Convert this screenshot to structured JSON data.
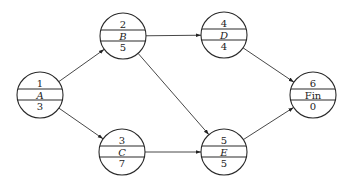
{
  "diagram": {
    "type": "activity-on-node network",
    "colors": {
      "stroke": "#2a2a2a",
      "edge": "#333333",
      "background": "#ffffff"
    },
    "radius": 23,
    "nodes": [
      {
        "id": "A",
        "top": "1",
        "name": "A",
        "bottom": "3",
        "cx": 40,
        "cy": 95,
        "italic": true
      },
      {
        "id": "B",
        "top": "2",
        "name": "B",
        "bottom": "5",
        "cx": 123,
        "cy": 36,
        "italic": true
      },
      {
        "id": "C",
        "top": "3",
        "name": "C",
        "bottom": "7",
        "cx": 122,
        "cy": 152,
        "italic": true
      },
      {
        "id": "D",
        "top": "4",
        "name": "D",
        "bottom": "4",
        "cx": 224,
        "cy": 35,
        "italic": true
      },
      {
        "id": "E",
        "top": "5",
        "name": "E",
        "bottom": "5",
        "cx": 224,
        "cy": 152,
        "italic": true
      },
      {
        "id": "Fin",
        "top": "6",
        "name": "Fin",
        "bottom": "0",
        "cx": 313,
        "cy": 95,
        "italic": false
      }
    ],
    "edges": [
      {
        "from": "A",
        "to": "B"
      },
      {
        "from": "A",
        "to": "C"
      },
      {
        "from": "B",
        "to": "D"
      },
      {
        "from": "B",
        "to": "E"
      },
      {
        "from": "C",
        "to": "E"
      },
      {
        "from": "D",
        "to": "Fin"
      },
      {
        "from": "E",
        "to": "Fin"
      }
    ]
  }
}
